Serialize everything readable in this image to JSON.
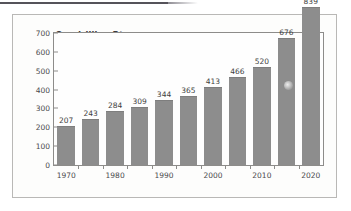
{
  "figure": {
    "frame_border_color": "#b9b8b6",
    "background_color": "#fdfdfc",
    "top_rule_color": "#55535a"
  },
  "chart_data": {
    "type": "bar",
    "title": "Quadrillion Btu",
    "subtitle": "",
    "xlabel": "",
    "ylabel": "Quadrillion Btu",
    "categories": [
      "1970",
      "1975",
      "1980",
      "1985",
      "1990",
      "1995",
      "2000",
      "2005",
      "2010",
      "2015",
      "2020"
    ],
    "values": [
      207,
      243,
      284,
      309,
      344,
      365,
      413,
      466,
      520,
      676,
      839
    ],
    "data_labels": [
      "207",
      "243",
      "284",
      "309",
      "344",
      "365",
      "413",
      "466",
      "520",
      "676",
      "839"
    ],
    "x_tick_labels": [
      "1970",
      "1980",
      "1990",
      "2000",
      "2010",
      "2020"
    ],
    "x_tick_label_categories": [
      "1970",
      "1980",
      "1990",
      "2000",
      "2010",
      "2020"
    ],
    "y_ticks": [
      0,
      100,
      200,
      300,
      400,
      500,
      600,
      700
    ],
    "y_tick_labels": [
      "0",
      "100",
      "200",
      "300",
      "400",
      "500",
      "600",
      "700"
    ],
    "ylim": [
      0,
      700
    ],
    "grid": false,
    "legend": false,
    "legend_position": "none",
    "bar_color": "#8d8d8d",
    "axis_color": "#8d8c8a",
    "text_color": "#3f3f41"
  }
}
